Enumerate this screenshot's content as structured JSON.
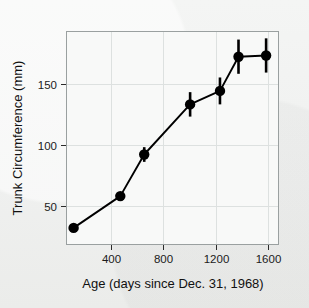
{
  "chart_data": {
    "type": "line",
    "title": "",
    "xlabel": "Age (days since Dec. 31, 1968)",
    "ylabel": "Trunk Circumference (mm)",
    "xlim": [
      60,
      1680
    ],
    "ylim": [
      18,
      193
    ],
    "xticks": [
      400,
      800,
      1200,
      1600
    ],
    "xtick_labels": [
      "400",
      "800",
      "1200",
      "1600"
    ],
    "yticks": [
      50,
      100,
      150
    ],
    "ytick_labels": [
      "50",
      "100",
      "150"
    ],
    "grid": true,
    "legend": "none",
    "marker": "filled-circle",
    "error_bars": "vertical",
    "line_color": "#000000",
    "marker_color": "#000000",
    "background_color": "#f2f3f2",
    "panel_color": "#f7f8f7",
    "grid_color": "#dadedd",
    "frame_color": "#9aa0a0",
    "x": [
      118,
      473,
      655,
      1004,
      1231,
      1372,
      1582
    ],
    "values": [
      32,
      58,
      92,
      133,
      144,
      172,
      173
    ],
    "yerr": [
      0,
      2,
      6,
      10,
      11,
      14,
      14
    ],
    "points": [
      {
        "x": 118,
        "y": 32,
        "yerr": 0
      },
      {
        "x": 473,
        "y": 58,
        "yerr": 2
      },
      {
        "x": 655,
        "y": 92,
        "yerr": 6
      },
      {
        "x": 1004,
        "y": 133,
        "yerr": 10
      },
      {
        "x": 1231,
        "y": 144,
        "yerr": 11
      },
      {
        "x": 1372,
        "y": 172,
        "yerr": 14
      },
      {
        "x": 1582,
        "y": 173,
        "yerr": 14
      }
    ]
  }
}
